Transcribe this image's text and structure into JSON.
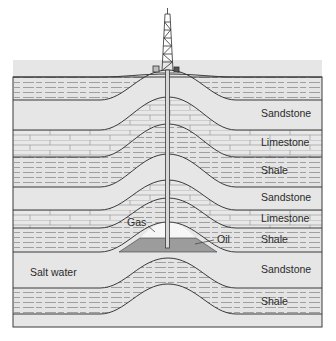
{
  "figure": {
    "type": "geologic-cross-section",
    "colors": {
      "background": "#ffffff",
      "rock_fill": "#e6e6e6",
      "line": "#3a3a3a",
      "dash": "#8a8a8a",
      "oil": "#9c9c9c",
      "gas": "#f6f6f6",
      "text": "#2a2a2a"
    },
    "icons": {
      "derrick": "oil-derrick-icon",
      "well": "well-pipe"
    }
  },
  "layers": [
    {
      "name": "Shale",
      "labelled": false
    },
    {
      "name": "Sandstone",
      "labelled": true
    },
    {
      "name": "Limestone",
      "labelled": true
    },
    {
      "name": "Shale",
      "labelled": true
    },
    {
      "name": "Sandstone",
      "labelled": true
    },
    {
      "name": "Limestone",
      "labelled": true
    },
    {
      "name": "Shale",
      "labelled": true
    },
    {
      "name": "Sandstone",
      "labelled": true
    },
    {
      "name": "Shale",
      "labelled": true
    },
    {
      "name": "Sandstone",
      "labelled": false
    }
  ],
  "labels": {
    "sandstone_1": "Sandstone",
    "limestone_1": "Limestone",
    "shale_1": "Shale",
    "sandstone_2": "Sandstone",
    "limestone_2": "Limestone",
    "shale_2": "Shale",
    "sandstone_3": "Sandstone",
    "shale_3": "Shale",
    "gas": "Gas",
    "oil": "Oil",
    "salt_water": "Salt water"
  }
}
